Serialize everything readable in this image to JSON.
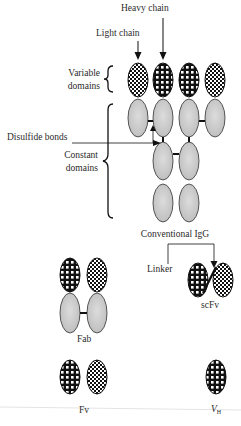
{
  "diagram": {
    "labels": {
      "heavy_chain": "Heavy chain",
      "light_chain": "Light chain",
      "variable_domains_1": "Variable",
      "variable_domains_2": "domains",
      "disulfide_bonds": "Disulfide bonds",
      "constant_domains_1": "Constant",
      "constant_domains_2": "domains",
      "conventional_igg": "Conventional IgG",
      "linker": "Linker",
      "scfv": "scFv",
      "fab": "Fab",
      "fv": "Fv",
      "vh_main": "V",
      "vh_sub": "H"
    },
    "structures": [
      {
        "name": "Conventional IgG",
        "variable_domains": 4,
        "constant_domains": 8
      },
      {
        "name": "Fab",
        "variable_domains": 2,
        "constant_domains": 2
      },
      {
        "name": "scFv",
        "variable_domains": 2,
        "constant_domains": 0,
        "linker": true
      },
      {
        "name": "Fv",
        "variable_domains": 2,
        "constant_domains": 0
      },
      {
        "name": "VH",
        "variable_domains": 1,
        "constant_domains": 0
      }
    ],
    "colors": {
      "constant_fill": "#c8c8c8",
      "outline": "#333333",
      "pattern_dark": "#111111",
      "background": "#ffffff"
    }
  }
}
